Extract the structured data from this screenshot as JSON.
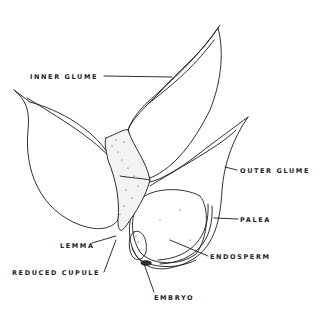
{
  "diagram": {
    "labels": {
      "inner_glume": "INNER GLUME",
      "outer_glume": "OUTER GLUME",
      "palea": "PALEA",
      "endosperm": "ENDOSPERM",
      "lemma": "LEMMA",
      "reduced_cupule": "REDUCED CUPULE",
      "embryo": "EMBRYO"
    },
    "colors": {
      "line": "#1a1a1a",
      "background": "#ffffff",
      "stipple": "#333333"
    }
  }
}
